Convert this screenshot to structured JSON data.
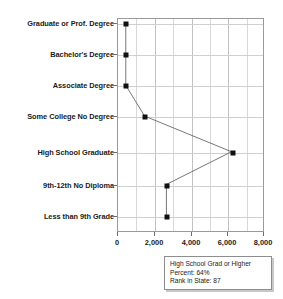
{
  "chart_data": {
    "type": "line",
    "title": "",
    "xlabel": "",
    "ylabel": "",
    "orientation": "horizontal",
    "categories": [
      "Graduate or Prof. Degree",
      "Bachelor's Degree",
      "Associate Degree",
      "Some College No Degree",
      "High School Graduate",
      "9th-12th No Diploma",
      "Less than 9th Grade"
    ],
    "values": [
      430,
      430,
      430,
      1470,
      6260,
      2670,
      2670
    ],
    "xlim": [
      0,
      8000
    ],
    "xticks": [
      0,
      2000,
      4000,
      6000,
      8000
    ],
    "xtick_labels": [
      "0",
      "2,000",
      "4,000",
      "6,000",
      "8,000"
    ],
    "gridlines_x_minor": [
      1000,
      3000,
      5000,
      7000
    ],
    "grid": true,
    "legend": "none",
    "marker": "square",
    "marker_color": "#111111",
    "line_color": "#555555"
  },
  "info_box": {
    "title": "High School Grad or Higher",
    "rows": [
      {
        "key": "Percent:",
        "value": "64%"
      },
      {
        "key": "Rank in State:",
        "value": "87"
      }
    ],
    "percent_label": "Percent:",
    "percent_value": "64%",
    "rank_label": "Rank in State:",
    "rank_value": "87"
  },
  "colors": {
    "frame": "#9a9a9a",
    "grid": "#d8d8d8",
    "marker": "#111111",
    "text": "#1a1a1a"
  }
}
